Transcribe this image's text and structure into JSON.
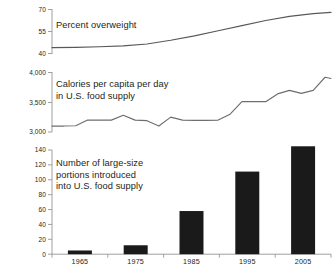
{
  "chart_data": [
    {
      "type": "line",
      "id": "percent-overweight",
      "title": "Percent overweight",
      "xlabel": "",
      "ylabel": "",
      "ylim": [
        40,
        70
      ],
      "yticks": [
        40,
        55,
        70
      ],
      "ytick_labels": [
        "40",
        "55",
        "70"
      ],
      "grid": false,
      "legend": "none",
      "line_color": "#58585a",
      "x": [
        1961,
        1965,
        1969,
        1973,
        1977,
        1981,
        1985,
        1989,
        1993,
        1997,
        2001,
        2005,
        2008
      ],
      "values": [
        44.0,
        44.2,
        44.6,
        45.2,
        46.5,
        49.0,
        52.0,
        55.5,
        59.0,
        62.5,
        65.3,
        67.2,
        68.0
      ]
    },
    {
      "type": "line",
      "id": "calories-per-capita",
      "title": "Calories per capita per day\nin U.S. food supply",
      "xlabel": "",
      "ylabel": "",
      "ylim": [
        3000,
        4000
      ],
      "yticks": [
        3000,
        3500,
        4000
      ],
      "ytick_labels": [
        "3,000",
        "3,500",
        "4,000"
      ],
      "grid": false,
      "legend": "none",
      "line_color": "#6d6e70",
      "x": [
        1961,
        1963,
        1965,
        1967,
        1969,
        1971,
        1973,
        1975,
        1977,
        1979,
        1981,
        1983,
        1985,
        1987,
        1989,
        1991,
        1993,
        1995,
        1997,
        1999,
        2001,
        2003,
        2005,
        2007,
        2008
      ],
      "values": [
        3100,
        3100,
        3105,
        3200,
        3200,
        3200,
        3280,
        3200,
        3190,
        3100,
        3250,
        3200,
        3195,
        3195,
        3200,
        3300,
        3510,
        3510,
        3510,
        3640,
        3700,
        3650,
        3700,
        3920,
        3900
      ]
    },
    {
      "type": "bar",
      "id": "large-size-portions",
      "title": "Number of large-size\nportions introduced\ninto U.S. food supply",
      "xlabel": "",
      "ylabel": "",
      "ylim": [
        0,
        140
      ],
      "yticks": [
        0,
        20,
        40,
        60,
        80,
        100,
        120,
        140
      ],
      "ytick_labels": [
        "0",
        "20",
        "40",
        "60",
        "80",
        "100",
        "120",
        "140"
      ],
      "grid": false,
      "legend": "none",
      "bar_color": "#1a1a1a",
      "categories": [
        "1965",
        "1975",
        "1985",
        "1995",
        "2005"
      ],
      "values": [
        5,
        12,
        58,
        111,
        145
      ]
    }
  ],
  "axis": {
    "x_tick_labels": [
      "1965",
      "1975",
      "1985",
      "1995",
      "2005"
    ]
  },
  "colors": {
    "line": "#6d6e70",
    "bar": "#1a1a1a",
    "axis": "#939598",
    "text": "#231f20"
  }
}
